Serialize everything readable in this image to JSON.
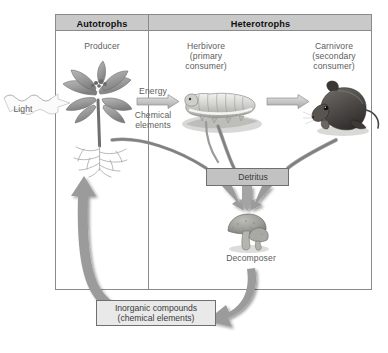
{
  "figure": {
    "type": "ecosystem-energy-flow-diagram",
    "frame": {
      "columns": [
        {
          "id": "autotrophs",
          "header": "Autotrophs"
        },
        {
          "id": "heterotrophs",
          "header": "Heterotrophs"
        }
      ]
    },
    "trophic_labels": {
      "producer": "Producer",
      "herbivore": "Herbivore\n(primary\nconsumer)",
      "carnivore": "Carnivore\n(secondary\nconsumer)",
      "decomposer": "Decomposer"
    },
    "flow_labels": {
      "light": "Light",
      "energy": "Energy",
      "chemical_elements": "Chemical\nelements"
    },
    "boxes": {
      "detritus": "Detritus",
      "inorganic": "Inorganic compounds\n(chemical elements)"
    },
    "organisms": [
      {
        "name": "plant",
        "role": "producer",
        "column": "autotrophs"
      },
      {
        "name": "caterpillar",
        "role": "herbivore",
        "column": "heterotrophs"
      },
      {
        "name": "mouse",
        "role": "carnivore",
        "column": "heterotrophs"
      },
      {
        "name": "mushrooms",
        "role": "decomposer",
        "column": "heterotrophs"
      }
    ],
    "colors": {
      "header_fill": "#c9c9c9",
      "box_fill": "#c2c2c2",
      "arrow_gray": "#8c8c8c",
      "frame_line": "#8a8a8a",
      "label_text": "#5d5d5d",
      "header_text": "#111111",
      "page_background": "#ffffff"
    }
  }
}
